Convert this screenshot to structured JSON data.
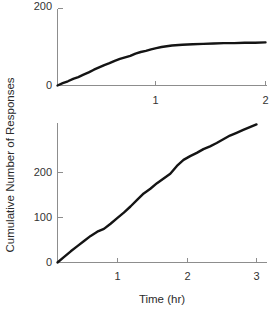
{
  "figure": {
    "ylabel": "Cumulative Number of Responses",
    "xlabel": "Time (hr)"
  },
  "chart_data": [
    {
      "type": "line",
      "title": "",
      "subtitle": "top panel — negatively accelerated cumulative record",
      "xlabel": "",
      "ylabel": "Cumulative Number of Responses",
      "xlim": [
        0,
        2
      ],
      "ylim": [
        0,
        200
      ],
      "xticks": [
        1,
        2
      ],
      "xticklabels": [
        "1",
        "2"
      ],
      "yticks": [
        0,
        200
      ],
      "yticklabels": [
        "0",
        "200"
      ],
      "grid": false,
      "legend": null,
      "x": [
        0.0,
        0.05,
        0.1,
        0.15,
        0.2,
        0.25,
        0.3,
        0.35,
        0.4,
        0.45,
        0.5,
        0.55,
        0.6,
        0.65,
        0.7,
        0.75,
        0.8,
        0.85,
        0.9,
        0.95,
        1.0,
        1.1,
        1.2,
        1.3,
        1.4,
        1.5,
        1.6,
        1.7,
        1.8,
        1.9,
        2.0
      ],
      "y": [
        0,
        6,
        11,
        17,
        22,
        28,
        34,
        41,
        47,
        53,
        58,
        64,
        69,
        73,
        77,
        83,
        87,
        90,
        94,
        97,
        100,
        104,
        106,
        107,
        108,
        109,
        110,
        110,
        111,
        111,
        112
      ]
    },
    {
      "type": "line",
      "title": "",
      "subtitle": "bottom panel — steady linear cumulative record",
      "xlabel": "Time (hr)",
      "ylabel": "Cumulative Number of Responses",
      "xlim": [
        0,
        3
      ],
      "ylim": [
        0,
        300
      ],
      "xticks": [
        1,
        2,
        3
      ],
      "xticklabels": [
        "1",
        "2",
        "3"
      ],
      "yticks": [
        0,
        100,
        200
      ],
      "yticklabels": [
        "0",
        "100",
        "200"
      ],
      "grid": false,
      "legend": null,
      "x": [
        0.0,
        0.1,
        0.2,
        0.3,
        0.4,
        0.5,
        0.6,
        0.7,
        0.8,
        0.9,
        1.0,
        1.1,
        1.2,
        1.3,
        1.4,
        1.5,
        1.6,
        1.7,
        1.8,
        1.9,
        2.0,
        2.1,
        2.2,
        2.3,
        2.4,
        2.5,
        2.6,
        2.7,
        2.8,
        2.9,
        3.0
      ],
      "y": [
        0,
        12,
        24,
        35,
        46,
        57,
        66,
        72,
        83,
        95,
        107,
        120,
        134,
        148,
        158,
        170,
        180,
        190,
        207,
        220,
        228,
        235,
        243,
        249,
        256,
        264,
        272,
        278,
        284,
        290,
        296
      ]
    }
  ]
}
